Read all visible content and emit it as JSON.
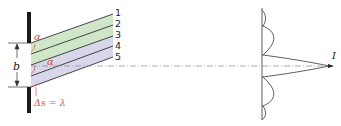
{
  "diagram": {
    "beam_labels": [
      "1",
      "2",
      "3",
      "4",
      "5"
    ],
    "slit_width_label": "b",
    "angle_label_top": "α",
    "angle_label_center": "α",
    "path_difference_label": "Δs = λ",
    "intensity_label": "I",
    "colors": {
      "upper_band": "#cfe6c8",
      "lower_band": "#d7d6ea",
      "accent": "#e0504a",
      "line": "#333333",
      "wall": "#1a1a1a"
    }
  }
}
